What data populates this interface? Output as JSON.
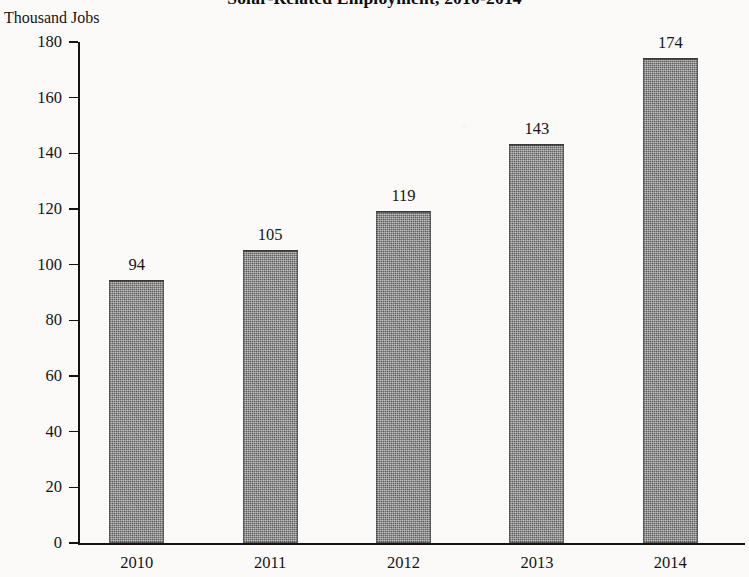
{
  "chart_data": {
    "type": "bar",
    "title": "Solar-Related Employment, 2010-2014",
    "ylabel": "Thousand Jobs",
    "xlabel": "",
    "categories": [
      "2010",
      "2011",
      "2012",
      "2013",
      "2014"
    ],
    "values": [
      94,
      105,
      119,
      143,
      174
    ],
    "value_labels": [
      "94",
      "105",
      "119",
      "143",
      "174"
    ],
    "ylim": [
      0,
      180
    ],
    "ytick_labels": [
      "0",
      "20",
      "40",
      "60",
      "80",
      "100",
      "120",
      "140",
      "160",
      "180"
    ],
    "yticks": [
      0,
      20,
      40,
      60,
      80,
      100,
      120,
      140,
      160,
      180
    ],
    "grid": false,
    "legend": null,
    "series": [
      {
        "name": "Solar-related employment",
        "values": [
          94,
          105,
          119,
          143,
          174
        ]
      }
    ],
    "colors": {
      "bar_fill": "#7b7b7b",
      "bar_border": "#3a3a3a",
      "axis": "#141414",
      "text": "#141414",
      "background": "#fbfaf8"
    }
  }
}
